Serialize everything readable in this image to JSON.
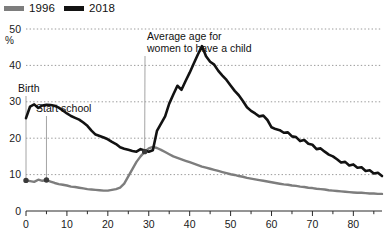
{
  "legend": {
    "entries": [
      {
        "label": "1996",
        "color": "#7d7d7d",
        "icon": "line-swatch"
      },
      {
        "label": "2018",
        "color": "#121212",
        "icon": "line-swatch"
      }
    ]
  },
  "annotations": {
    "birth": "Birth",
    "start_school": "Start school",
    "avg_age_line1": "Average age for",
    "avg_age_line2": "women to have a child"
  },
  "axis": {
    "y_unit": "%",
    "y_ticks": [
      "0",
      "10",
      "20",
      "30",
      "40",
      "50"
    ],
    "x_ticks": [
      "0",
      "10",
      "20",
      "30",
      "40",
      "50",
      "60",
      "70",
      "80"
    ]
  },
  "chart_data": {
    "type": "line",
    "title": "",
    "subtitle": "",
    "xlabel": "",
    "ylabel": "%",
    "xlim": [
      0,
      87
    ],
    "ylim": [
      0,
      50
    ],
    "grid": true,
    "grid_axis": "y",
    "grid_style": "dotted",
    "legend_position": "top-left",
    "annotations": [
      {
        "text": "Birth",
        "x": 0,
        "y": 8.5,
        "leader": "vertical"
      },
      {
        "text": "Start school",
        "x": 5,
        "y": 8.6,
        "leader": "vertical"
      },
      {
        "text": "Average age for women to have a child",
        "x": 29,
        "y": 14.5,
        "leader": "diagonal"
      }
    ],
    "x": [
      0,
      1,
      2,
      3,
      4,
      5,
      6,
      7,
      8,
      9,
      10,
      11,
      12,
      13,
      14,
      15,
      16,
      17,
      18,
      19,
      20,
      21,
      22,
      23,
      24,
      25,
      26,
      27,
      28,
      29,
      30,
      31,
      32,
      33,
      34,
      35,
      36,
      37,
      38,
      39,
      40,
      41,
      42,
      43,
      44,
      45,
      46,
      47,
      48,
      49,
      50,
      51,
      52,
      53,
      54,
      55,
      56,
      57,
      58,
      59,
      60,
      61,
      62,
      63,
      64,
      65,
      66,
      67,
      68,
      69,
      70,
      71,
      72,
      73,
      74,
      75,
      76,
      77,
      78,
      79,
      80,
      81,
      82,
      83,
      84,
      85,
      86,
      87
    ],
    "series": [
      {
        "name": "2018",
        "color": "#121212",
        "values": [
          25.5,
          28.7,
          29.3,
          28.3,
          29.0,
          29.2,
          29.1,
          28.9,
          28.4,
          27.6,
          26.8,
          26.1,
          25.6,
          25.1,
          24.3,
          23.4,
          22.1,
          21.0,
          20.6,
          20.2,
          19.7,
          19.0,
          18.4,
          17.5,
          17.1,
          16.8,
          16.5,
          16.3,
          17.0,
          16.6,
          16.3,
          16.7,
          22.0,
          24.0,
          26.0,
          29.5,
          32.0,
          34.4,
          33.3,
          35.7,
          38.0,
          40.5,
          43.0,
          45.3,
          42.5,
          41.0,
          40.2,
          38.5,
          37.2,
          36.0,
          34.5,
          33.0,
          31.8,
          30.2,
          28.5,
          27.5,
          26.8,
          26.0,
          26.2,
          25.0,
          23.0,
          22.5,
          22.2,
          21.5,
          21.6,
          20.5,
          20.3,
          19.2,
          19.5,
          18.5,
          18.2,
          17.0,
          17.2,
          16.3,
          15.5,
          15.0,
          14.2,
          13.3,
          13.5,
          12.5,
          12.8,
          11.9,
          12.0,
          11.0,
          11.2,
          10.3,
          10.5,
          9.6
        ],
        "values_note": "percent of population; index of array is age in years"
      },
      {
        "name": "1996",
        "color": "#7d7d7d",
        "values": [
          8.4,
          8.2,
          8.0,
          8.6,
          8.3,
          8.5,
          8.1,
          7.7,
          7.4,
          7.2,
          7.0,
          6.7,
          6.6,
          6.4,
          6.2,
          6.0,
          5.9,
          5.8,
          5.7,
          5.6,
          5.6,
          5.8,
          6.0,
          6.4,
          7.5,
          9.5,
          11.5,
          13.5,
          15.0,
          16.3,
          17.2,
          17.6,
          17.3,
          16.8,
          16.2,
          15.6,
          15.0,
          14.6,
          14.2,
          13.8,
          13.4,
          13.0,
          12.6,
          12.2,
          11.9,
          11.6,
          11.3,
          11.0,
          10.7,
          10.4,
          10.1,
          9.9,
          9.6,
          9.4,
          9.1,
          8.9,
          8.7,
          8.5,
          8.3,
          8.1,
          7.9,
          7.7,
          7.5,
          7.3,
          7.2,
          7.0,
          6.9,
          6.7,
          6.6,
          6.4,
          6.3,
          6.1,
          6.0,
          5.9,
          5.7,
          5.6,
          5.5,
          5.4,
          5.3,
          5.2,
          5.1,
          5.0,
          5.0,
          4.9,
          4.8,
          4.8,
          4.7,
          4.7
        ],
        "values_note": "percent of population; index of array is age in years"
      }
    ]
  }
}
